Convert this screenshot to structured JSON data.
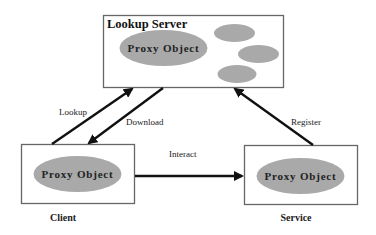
{
  "diagram": {
    "title": "Lookup Server",
    "nodes": {
      "lookup_server": {
        "label": "Lookup Server",
        "inner_label": "Proxy Object",
        "extra_objects": 3
      },
      "client": {
        "inner_label": "Proxy Object",
        "caption": "Client"
      },
      "service": {
        "inner_label": "Proxy Object",
        "caption": "Service"
      }
    },
    "edges": [
      {
        "from": "client",
        "to": "lookup_server",
        "label": "Lookup"
      },
      {
        "from": "lookup_server",
        "to": "client",
        "label": "Download"
      },
      {
        "from": "client",
        "to": "service",
        "label": "Interact"
      },
      {
        "from": "service",
        "to": "lookup_server",
        "label": "Register"
      }
    ]
  },
  "colors": {
    "ellipse_fill": "#a9a9a9",
    "stroke": "#111111",
    "box_stroke": "#666666"
  }
}
